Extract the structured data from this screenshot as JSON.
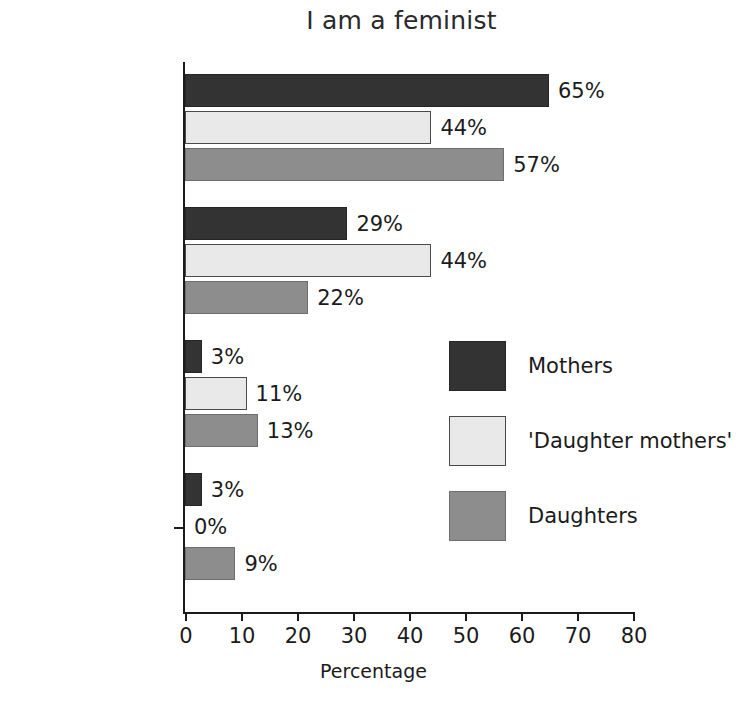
{
  "chart_data": {
    "type": "bar",
    "orientation": "horizontal",
    "title": "I am a feminist",
    "xlabel": "Percentage",
    "ylabel": "",
    "xlim": [
      0,
      80
    ],
    "xticks": [
      0,
      10,
      20,
      30,
      40,
      50,
      60,
      70,
      80
    ],
    "grid": false,
    "legend_position": "center-right",
    "categories": [
      "Agree",
      "Neither agree\nnor disagree",
      "Disagree",
      "Don't know"
    ],
    "series": [
      {
        "name": "Mothers",
        "color": "#333333",
        "values": [
          65,
          29,
          3,
          3
        ],
        "labels": [
          "65%",
          "29%",
          "3%",
          "3%"
        ]
      },
      {
        "name": "'Daughter mothers'",
        "color": "#e9e9e9",
        "values": [
          44,
          44,
          11,
          0
        ],
        "labels": [
          "44%",
          "44%",
          "11%",
          "0%"
        ]
      },
      {
        "name": "Daughters",
        "color": "#8d8d8d",
        "values": [
          57,
          22,
          13,
          9
        ],
        "labels": [
          "57%",
          "22%",
          "13%",
          "9%"
        ]
      }
    ]
  },
  "axis": {
    "tick_labels": [
      "0",
      "10",
      "20",
      "30",
      "40",
      "50",
      "60",
      "70",
      "80"
    ],
    "x_title": "Percentage"
  },
  "legend": {
    "items": [
      {
        "label": "Mothers"
      },
      {
        "label": "'Daughter mothers'"
      },
      {
        "label": "Daughters"
      }
    ]
  }
}
